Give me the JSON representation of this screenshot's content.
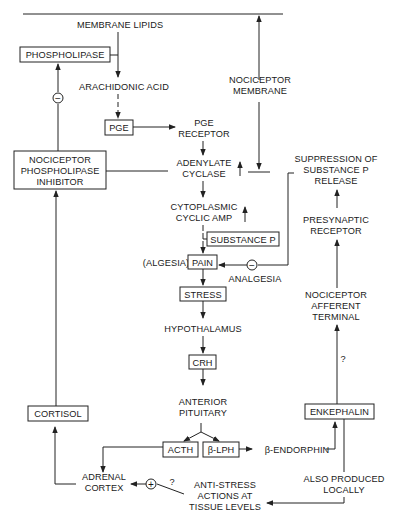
{
  "diagram": {
    "nodes": {
      "membrane_lipids": "MEMBRANE LIPIDS",
      "phospholipase": "PHOSPHOLIPASE",
      "arachidonic_acid": "ARACHIDONIC ACID",
      "pge": "PGE",
      "pge_receptor": [
        "PGE",
        "RECEPTOR"
      ],
      "nociceptor_membrane": [
        "NOCICEPTOR",
        "MEMBRANE"
      ],
      "nociceptor_phospholipase_inhibitor": [
        "NOCICEPTOR",
        "PHOSPHOLIPASE",
        "INHIBITOR"
      ],
      "adenylate_cyclase": [
        "ADENYLATE",
        "CYCLASE"
      ],
      "cytoplasmic_cyclic_amp": [
        "CYTOPLASMIC",
        "CYCLIC AMP"
      ],
      "substance_p": "SUBSTANCE P",
      "algesia": "(ALGESIA)",
      "pain": "PAIN",
      "analgesia": "ANALGESIA",
      "suppression": [
        "SUPPRESSION OF",
        "SUBSTANCE P",
        "RELEASE"
      ],
      "presynaptic_receptor": [
        "PRESYNAPTIC",
        "RECEPTOR"
      ],
      "nociceptor_afferent_terminal": [
        "NOCICEPTOR",
        "AFFERENT",
        "TERMINAL"
      ],
      "stress": "STRESS",
      "hypothalamus": "HYPOTHALAMUS",
      "crh": "CRH",
      "anterior_pituitary": [
        "ANTERIOR",
        "PITUITARY"
      ],
      "acth": "ACTH",
      "beta_lph": "β-LPH",
      "beta_endorphin": "β-ENDORPHIN",
      "enkephalin": "ENKEPHALIN",
      "cortisol": "CORTISOL",
      "adrenal_cortex": [
        "ADRENAL",
        "CORTEX"
      ],
      "anti_stress": [
        "ANTI-STRESS",
        "ACTIONS AT",
        "TISSUE LEVELS"
      ],
      "also_produced_locally": [
        "ALSO PRODUCED",
        "LOCALLY"
      ]
    },
    "symbols": {
      "inhibit": "−",
      "stimulate": "+",
      "uncertain": "?",
      "increase": "↑"
    }
  }
}
